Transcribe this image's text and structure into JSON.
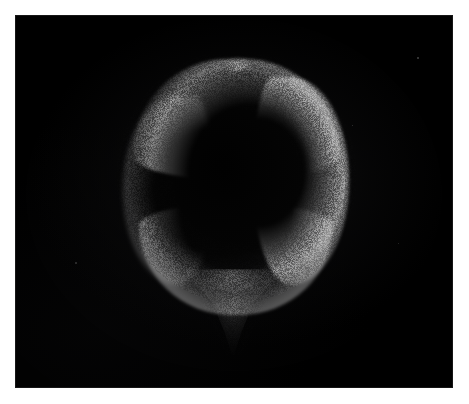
{
  "image": {
    "caption": "",
    "kind": "dark-field specimen photograph",
    "subject_label": "",
    "background_color": "#000000",
    "mount_color": "#ffffff",
    "plate": {
      "left": 15,
      "top": 15,
      "width": 438,
      "height": 373
    },
    "canvas": {
      "width": 469,
      "height": 404
    }
  },
  "subject": {
    "name": "balloon-shaped specimen",
    "description": "Round body with a bright granular outer shell and a very dark interior, tapering to a pointed tail at the bottom.",
    "bounding_box": {
      "left": 128,
      "top": 62,
      "right": 342,
      "bottom": 338
    },
    "rim_highlight_color": "#8a8a8a",
    "interior_color": "#030303",
    "lighting_direction": "upper-right",
    "features": [
      {
        "name": "crown-notch",
        "description": "small bump at the top apex of the rim"
      },
      {
        "name": "bright-right-limb",
        "description": "brightest granular limb along the right shoulder"
      },
      {
        "name": "dim-left-limb",
        "description": "dimmer granular limb along the left side"
      },
      {
        "name": "lower-rim-arc",
        "description": "bright arc sweeping across the bottom of the body"
      },
      {
        "name": "tapering-tail",
        "description": "speckled triangular tail descending from the base"
      }
    ]
  },
  "field_specks": [
    {
      "id": "speck-upper-right",
      "x": 417,
      "y": 57,
      "size": 2,
      "brightness": 0.45
    },
    {
      "id": "speck-mid-right",
      "x": 335,
      "y": 197,
      "size": 2,
      "brightness": 0.35
    },
    {
      "id": "speck-lower-left",
      "x": 75,
      "y": 262,
      "size": 2,
      "brightness": 0.3
    },
    {
      "id": "speck-right-edge",
      "x": 352,
      "y": 125,
      "size": 1,
      "brightness": 0.3
    },
    {
      "id": "speck-far-right",
      "x": 398,
      "y": 243,
      "size": 1,
      "brightness": 0.25
    }
  ]
}
